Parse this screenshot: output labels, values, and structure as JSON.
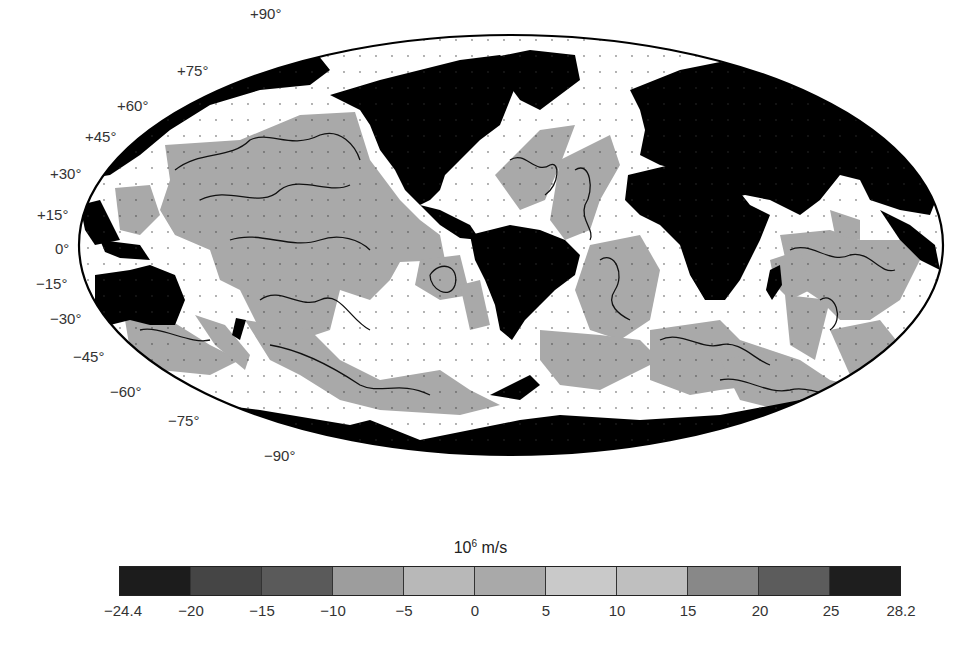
{
  "map": {
    "projection": "Robinson-like (elliptical)",
    "land_color": "#000000",
    "positive_region_color": "#a9a9a9",
    "near_zero_region_color": "#ffffff",
    "latitude_labels": [
      {
        "text": "+90°",
        "x": 250,
        "y": 5
      },
      {
        "text": "+75°",
        "x": 177,
        "y": 62
      },
      {
        "text": "+60°",
        "x": 117,
        "y": 97
      },
      {
        "text": "+45°",
        "x": 85,
        "y": 128
      },
      {
        "text": "+30°",
        "x": 50,
        "y": 165
      },
      {
        "text": "+15°",
        "x": 37,
        "y": 206
      },
      {
        "text": "0°",
        "x": 55,
        "y": 240
      },
      {
        "text": "−15°",
        "x": 36,
        "y": 275
      },
      {
        "text": "−30°",
        "x": 50,
        "y": 310
      },
      {
        "text": "−45°",
        "x": 73,
        "y": 348
      },
      {
        "text": "−60°",
        "x": 110,
        "y": 383
      },
      {
        "text": "−75°",
        "x": 168,
        "y": 412
      },
      {
        "text": "−90°",
        "x": 264,
        "y": 447
      }
    ]
  },
  "colorbar": {
    "title_base": "10",
    "title_exp": "6",
    "title_unit": " m/s",
    "segments": [
      "#1c1c1c",
      "#454545",
      "#5a5a5a",
      "#9d9d9d",
      "#b8b8b8",
      "#a9a9a9",
      "#c9c9c9",
      "#bfbfbf",
      "#888888",
      "#5c5c5c",
      "#1e1e1e"
    ],
    "ticks": [
      "−24.4",
      "−20",
      "−15",
      "−10",
      "−5",
      "0",
      "5",
      "10",
      "15",
      "20",
      "25",
      "28.2"
    ],
    "tick_x": [
      123,
      191,
      262,
      333,
      404,
      475,
      546,
      617,
      688,
      760,
      831,
      901
    ]
  }
}
